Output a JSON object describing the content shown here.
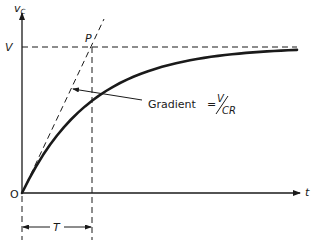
{
  "diagram": {
    "labels": {
      "y_axis": "v",
      "y_axis_sub": "C",
      "x_axis": "t",
      "origin": "O",
      "level": "V",
      "point": "P",
      "time_constant": "T",
      "gradient_text": "Gradient",
      "equals": "=",
      "gradient_num": "V",
      "gradient_den": "CR"
    },
    "colors": {
      "ink": "#1a1a1a",
      "background": "#ffffff"
    },
    "curve": {
      "equation": "v_C = V(1 - e^(-t/CR))",
      "asymptote": "V",
      "tangent_at_origin_meets_V_at": "P",
      "time_to_P": "T"
    }
  }
}
